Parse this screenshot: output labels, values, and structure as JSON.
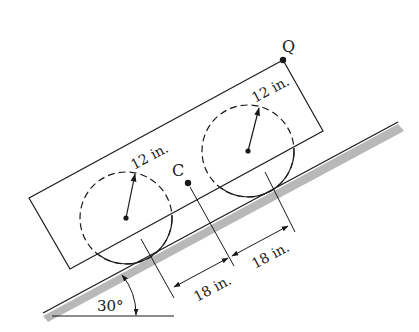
{
  "figure": {
    "type": "engineering-mechanics-diagram",
    "incline_angle_label": "30°",
    "point_q_label": "Q",
    "center_label": "C",
    "left_wheel_radius_label": "12 in.",
    "right_wheel_radius_label": "12 in.",
    "dim_left_label": "18 in.",
    "dim_right_label": "18 in."
  },
  "colors": {
    "line": "#1a1a1a",
    "ground_shade": "#b8b8b8",
    "background": "#ffffff"
  }
}
